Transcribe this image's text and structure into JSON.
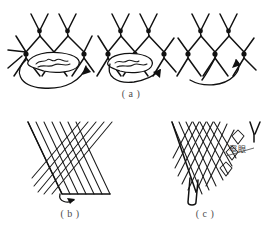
{
  "figure": {
    "background_color": "#ffffff",
    "ink_color": "#111111",
    "caption_color": "#4d4d4d",
    "width": 262,
    "height": 235
  },
  "panels": [
    {
      "id": "a",
      "caption": "( a )",
      "description": "three net fragments showing the needle threading sequence",
      "steps": [
        {
          "id": "a1",
          "name": "step-left",
          "arrow": "large-loop-down-right"
        },
        {
          "id": "a2",
          "name": "step-middle",
          "arrow": "loop-down-right"
        },
        {
          "id": "a3",
          "name": "step-right",
          "arrow": "hook-up-right"
        }
      ]
    },
    {
      "id": "b",
      "caption": "( b )",
      "description": "finished diamond mesh panel with slanted left selvedge"
    },
    {
      "id": "c",
      "caption": "( c )",
      "description": "diamond mesh panel with stepped right selvedge",
      "annotation": {
        "text": "窄眼",
        "name": "narrow-mesh-label"
      }
    }
  ]
}
